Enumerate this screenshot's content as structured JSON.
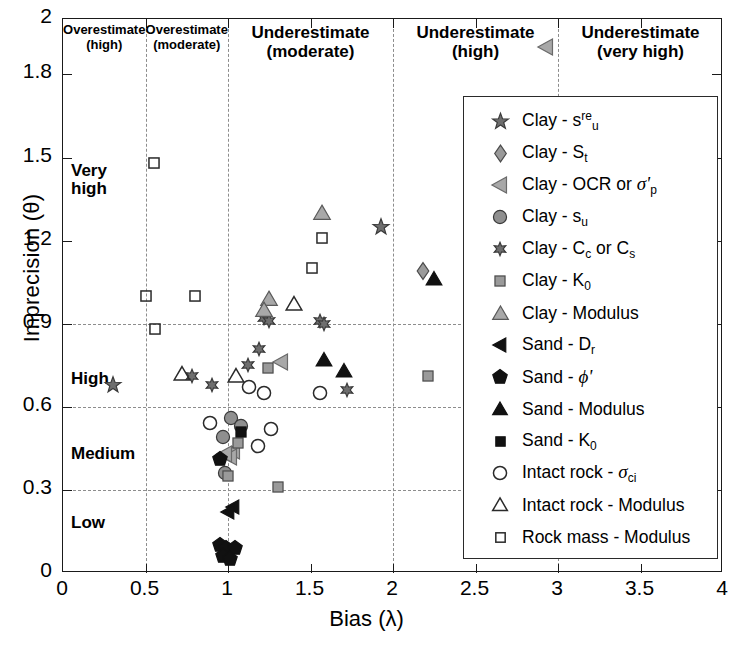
{
  "chart_data": {
    "type": "scatter",
    "title": "",
    "xlabel": "Bias (λ)",
    "ylabel": "Imprecision (θ)",
    "xlim": [
      0,
      4
    ],
    "ylim": [
      0,
      2
    ],
    "xticks": [
      0,
      0.5,
      1,
      1.5,
      2,
      2.5,
      3,
      3.5,
      4
    ],
    "xticklabels": [
      "0",
      "0.5",
      "1",
      "1.5",
      "2",
      "2.5",
      "3",
      "3.5",
      "4"
    ],
    "yticks": [
      0,
      0.3,
      0.6,
      0.9,
      1.2,
      1.5,
      1.8,
      2
    ],
    "yticklabels": [
      "0",
      "0.3",
      "0.6",
      "0.9",
      "1.2",
      "1.5",
      "1.8",
      "2"
    ],
    "grid": "dashed gridlines at x = 0.5, 1, 2, 3 and y = 0.3, 0.6, 0.9",
    "gridlines_x": [
      0.5,
      1,
      2,
      3
    ],
    "gridlines_y": [
      0.3,
      0.6,
      0.9
    ],
    "legend_position": "right-center",
    "zone_labels": [
      {
        "line1": "Overestimate",
        "line2": "(high)",
        "x_range": [
          0,
          0.5
        ],
        "size": 13
      },
      {
        "line1": "Overestimate",
        "line2": "(moderate)",
        "x_range": [
          0.5,
          1.0
        ],
        "size": 13
      },
      {
        "line1": "Underestimate",
        "line2": "(moderate)",
        "x_range": [
          1.0,
          2.0
        ],
        "size": 17
      },
      {
        "line1": "Underestimate",
        "line2": "(high)",
        "x_range": [
          2.0,
          3.0
        ],
        "size": 17
      },
      {
        "line1": "Underestimate",
        "line2": "(very high)",
        "x_range": [
          3.0,
          4.0
        ],
        "size": 17
      }
    ],
    "band_labels": [
      {
        "text": "Very\nhigh",
        "y": 1.42
      },
      {
        "text": "High",
        "y": 0.7
      },
      {
        "text": "Medium",
        "y": 0.43
      },
      {
        "text": "Low",
        "y": 0.18
      }
    ],
    "series": [
      {
        "name": "Clay - s_u^re",
        "marker": "star5",
        "fill": "#6e6e6e",
        "edge": "#3a3a3a",
        "points": [
          [
            1.93,
            1.25
          ],
          [
            0.3,
            0.68
          ]
        ]
      },
      {
        "name": "Clay - S_t",
        "marker": "diamond",
        "fill": "#9a9a9a",
        "edge": "#4a4a4a",
        "points": [
          [
            2.18,
            1.09
          ]
        ]
      },
      {
        "name": "Clay - OCR or sigma'_p",
        "marker": "triangle-left",
        "fill": "#a8a8a8",
        "edge": "#6a6a6a",
        "points": [
          [
            2.93,
            1.9
          ],
          [
            1.32,
            0.76
          ],
          [
            1.03,
            0.44
          ],
          [
            1.01,
            0.42
          ],
          [
            0.98,
            0.43
          ]
        ]
      },
      {
        "name": "Clay - s_u",
        "marker": "circle",
        "fill": "#8f8f8f",
        "edge": "#3a3a3a",
        "points": [
          [
            1.02,
            0.56
          ],
          [
            1.08,
            0.53
          ],
          [
            0.97,
            0.49
          ],
          [
            0.98,
            0.36
          ]
        ]
      },
      {
        "name": "Clay - C_c or C_s",
        "marker": "star6",
        "fill": "#6e6e6e",
        "edge": "#3a3a3a",
        "points": [
          [
            1.22,
            0.92
          ],
          [
            1.25,
            0.91
          ],
          [
            1.56,
            0.91
          ],
          [
            1.58,
            0.9
          ],
          [
            1.19,
            0.81
          ],
          [
            1.12,
            0.75
          ],
          [
            0.78,
            0.71
          ],
          [
            0.9,
            0.68
          ],
          [
            1.72,
            0.66
          ]
        ]
      },
      {
        "name": "Clay - K_0",
        "marker": "square",
        "fill": "#9a9a9a",
        "edge": "#4a4a4a",
        "points": [
          [
            1.24,
            0.74
          ],
          [
            2.21,
            0.71
          ],
          [
            1.06,
            0.47
          ],
          [
            1.0,
            0.35
          ],
          [
            1.3,
            0.31
          ]
        ]
      },
      {
        "name": "Clay - Modulus",
        "marker": "triangle-up",
        "fill": "#a8a8a8",
        "edge": "#5a5a5a",
        "points": [
          [
            1.57,
            1.3
          ],
          [
            1.25,
            0.99
          ],
          [
            1.22,
            0.95
          ]
        ]
      },
      {
        "name": "Sand - D_r",
        "marker": "triangle-left-filled",
        "fill": "#111111",
        "edge": "#111111",
        "points": [
          [
            1.03,
            0.24
          ],
          [
            1.0,
            0.22
          ]
        ]
      },
      {
        "name": "Sand - phi'",
        "marker": "pentagon-filled",
        "fill": "#111111",
        "edge": "#111111",
        "points": [
          [
            0.95,
            0.41
          ],
          [
            0.95,
            0.1
          ],
          [
            0.99,
            0.09
          ],
          [
            1.04,
            0.09
          ],
          [
            0.97,
            0.06
          ],
          [
            1.01,
            0.05
          ]
        ]
      },
      {
        "name": "Sand - Modulus",
        "marker": "triangle-up-filled",
        "fill": "#111111",
        "edge": "#111111",
        "points": [
          [
            2.25,
            1.06
          ],
          [
            1.58,
            0.77
          ],
          [
            1.7,
            0.73
          ]
        ]
      },
      {
        "name": "Sand - K_0",
        "marker": "square-filled",
        "fill": "#111111",
        "edge": "#111111",
        "points": [
          [
            1.08,
            0.51
          ]
        ]
      },
      {
        "name": "Intact rock - sigma_ci",
        "marker": "circle-open",
        "fill": "none",
        "edge": "#2a2a2a",
        "points": [
          [
            1.13,
            0.67
          ],
          [
            1.22,
            0.65
          ],
          [
            1.56,
            0.65
          ],
          [
            0.89,
            0.54
          ],
          [
            1.26,
            0.52
          ],
          [
            1.18,
            0.46
          ]
        ]
      },
      {
        "name": "Intact rock - Modulus",
        "marker": "triangle-up-open",
        "fill": "none",
        "edge": "#2a2a2a",
        "points": [
          [
            1.4,
            0.97
          ],
          [
            0.72,
            0.72
          ],
          [
            1.05,
            0.71
          ]
        ]
      },
      {
        "name": "Rock mass - Modulus",
        "marker": "square-open",
        "fill": "none",
        "edge": "#2a2a2a",
        "points": [
          [
            0.55,
            1.48
          ],
          [
            1.57,
            1.21
          ],
          [
            1.51,
            1.1
          ],
          [
            0.5,
            1.0
          ],
          [
            0.8,
            1.0
          ],
          [
            0.56,
            0.88
          ]
        ]
      }
    ]
  },
  "legend": {
    "items": [
      {
        "marker": "star5",
        "base": "Clay - s",
        "sup": "re",
        "sub": "u",
        "italic": ""
      },
      {
        "marker": "diamond",
        "base": "Clay - S",
        "sup": "",
        "sub": "t",
        "italic": ""
      },
      {
        "marker": "triangle-left",
        "base": "Clay - OCR or ",
        "sup": "",
        "sub": "p",
        "italic": "σ'"
      },
      {
        "marker": "circle",
        "base": "Clay - s",
        "sup": "",
        "sub": "u",
        "italic": ""
      },
      {
        "marker": "star6",
        "base": "Clay - C",
        "sup": "",
        "sub": "c",
        "italic": "",
        "tail": " or C",
        "tailsub": "s"
      },
      {
        "marker": "square",
        "base": "Clay - K",
        "sup": "",
        "sub": "0",
        "italic": ""
      },
      {
        "marker": "triangle-up",
        "base": "Clay - Modulus",
        "sup": "",
        "sub": "",
        "italic": ""
      },
      {
        "marker": "triangle-left-filled",
        "base": "Sand - D",
        "sup": "",
        "sub": "r",
        "italic": ""
      },
      {
        "marker": "pentagon-filled",
        "base": "Sand - ",
        "sup": "",
        "sub": "",
        "italic": "ϕ'"
      },
      {
        "marker": "triangle-up-filled",
        "base": "Sand - Modulus",
        "sup": "",
        "sub": "",
        "italic": ""
      },
      {
        "marker": "square-filled",
        "base": "Sand - K",
        "sup": "",
        "sub": "0",
        "italic": ""
      },
      {
        "marker": "circle-open",
        "base": "Intact rock - ",
        "sup": "",
        "sub": "ci",
        "italic": "σ"
      },
      {
        "marker": "triangle-up-open",
        "base": "Intact rock - Modulus",
        "sup": "",
        "sub": "",
        "italic": ""
      },
      {
        "marker": "square-open",
        "base": "Rock mass - Modulus",
        "sup": "",
        "sub": "",
        "italic": ""
      }
    ]
  },
  "colors": {
    "axis": "#1a1a1a",
    "grid": "#8d8d8d",
    "gray_fill": "#9a9a9a",
    "black_fill": "#111111",
    "background": "#ffffff"
  }
}
